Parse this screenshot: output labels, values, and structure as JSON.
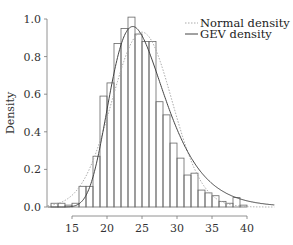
{
  "chart_data": {
    "type": "bar",
    "subtype": "histogram-with-density-curves",
    "title": "",
    "xlabel": "",
    "ylabel": "Density",
    "xlim": [
      11.5,
      44
    ],
    "ylim": [
      0,
      1.05
    ],
    "x_ticks": [
      15,
      20,
      25,
      30,
      35,
      40
    ],
    "y_ticks": [
      "0.0",
      "0.2",
      "0.4",
      "0.6",
      "0.8",
      "1.0"
    ],
    "grid": false,
    "legend_position": "top-right",
    "bin_width": 1,
    "bins": [
      {
        "start": 12,
        "value": 0.02
      },
      {
        "start": 13,
        "value": 0.02
      },
      {
        "start": 14,
        "value": 0.01
      },
      {
        "start": 15,
        "value": 0.02
      },
      {
        "start": 16,
        "value": 0.11
      },
      {
        "start": 17,
        "value": 0.11
      },
      {
        "start": 18,
        "value": 0.27
      },
      {
        "start": 19,
        "value": 0.59
      },
      {
        "start": 20,
        "value": 0.66
      },
      {
        "start": 21,
        "value": 0.87
      },
      {
        "start": 22,
        "value": 0.95
      },
      {
        "start": 23,
        "value": 1.01
      },
      {
        "start": 24,
        "value": 0.92
      },
      {
        "start": 25,
        "value": 0.88
      },
      {
        "start": 26,
        "value": 0.88
      },
      {
        "start": 27,
        "value": 0.56
      },
      {
        "start": 28,
        "value": 0.49
      },
      {
        "start": 29,
        "value": 0.34
      },
      {
        "start": 30,
        "value": 0.26
      },
      {
        "start": 31,
        "value": 0.17
      },
      {
        "start": 32,
        "value": 0.18
      },
      {
        "start": 33,
        "value": 0.09
      },
      {
        "start": 34,
        "value": 0.075
      },
      {
        "start": 35,
        "value": 0.06
      },
      {
        "start": 36,
        "value": 0.03
      },
      {
        "start": 37,
        "value": 0.02
      },
      {
        "start": 38,
        "value": 0.05
      },
      {
        "start": 39,
        "value": 0.01
      }
    ],
    "series": [
      {
        "name": "Normal density",
        "style": "dotted",
        "color": "#aaaaaa",
        "mean": 25.0,
        "sd": 4.3,
        "peak": 0.93
      },
      {
        "name": "GEV density",
        "style": "solid",
        "color": "#555555",
        "location": 23.6,
        "scale": 3.85,
        "shape": -0.02,
        "peak": 0.96
      }
    ]
  },
  "legend": {
    "items": [
      {
        "label": "Normal density",
        "style": "dotted"
      },
      {
        "label": "GEV density",
        "style": "solid"
      }
    ]
  },
  "colors": {
    "bar_stroke": "#666666",
    "axis": "#777777",
    "normal_curve": "#aaaaaa",
    "gev_curve": "#444444"
  }
}
